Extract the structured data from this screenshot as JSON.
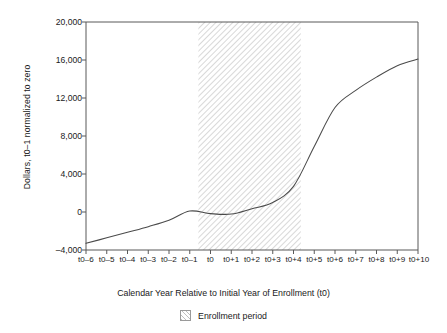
{
  "chart_data": {
    "type": "line",
    "title": "",
    "subtitle": "",
    "xlabel": "Calendar Year Relative to Initial Year of Enrollment (t0)",
    "ylabel": "Dollars, t0–1 normalized to zero",
    "grid": false,
    "legend_position": "bottom",
    "xlim": [
      0,
      16
    ],
    "ylim": [
      -4000,
      20000
    ],
    "ytick_values": [
      -4000,
      0,
      4000,
      8000,
      12000,
      16000,
      20000
    ],
    "ytick_labels": [
      "–4,000",
      "0",
      "4,000",
      "8,000",
      "12,000",
      "16,000",
      "20,000"
    ],
    "categories": [
      "t0–6",
      "t0–5",
      "t0–4",
      "t0–3",
      "t0–2",
      "t0–1",
      "t0",
      "t0+1",
      "t0+2",
      "t0+3",
      "t0+4",
      "t0+5",
      "t0+6",
      "t0+7",
      "t0+8",
      "t0+9",
      "t0+10"
    ],
    "series": [
      {
        "name": "Dollars",
        "values": [
          -3300,
          -2720,
          -2130,
          -1540,
          -870,
          100,
          -170,
          -220,
          350,
          1000,
          2700,
          6900,
          11000,
          12800,
          14200,
          15400,
          16100
        ]
      }
    ],
    "annotations": [
      {
        "type": "span",
        "label": "Enrollment period",
        "x_start": "t0",
        "x_end": "t0+4",
        "style": "hatched"
      }
    ],
    "legend": [
      {
        "label": "Enrollment period",
        "swatch": "hatched-square"
      }
    ]
  }
}
